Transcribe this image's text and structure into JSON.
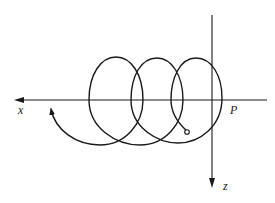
{
  "diagram": {
    "type": "helical trajectory (prolate cycloid/spiral) projected onto x-z plane",
    "axes": {
      "horizontal": {
        "label": "x",
        "direction": "left"
      },
      "vertical": {
        "label": "z",
        "direction": "down"
      }
    },
    "point_label": "P",
    "loops": 3,
    "start_marker": "small open circle",
    "end_marker": "arrowhead",
    "colors": {
      "stroke": "#1a1a1a",
      "background": "#ffffff"
    }
  }
}
